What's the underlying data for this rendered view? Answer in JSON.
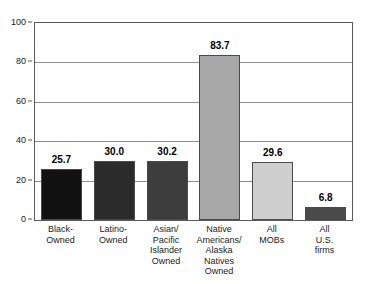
{
  "title_sliver": "",
  "chart_data": {
    "type": "bar",
    "title": "",
    "subtitle": "",
    "xlabel": "",
    "ylabel": "",
    "ylim": [
      0,
      100
    ],
    "y_ticks": [
      0,
      20,
      40,
      60,
      80,
      100
    ],
    "grid": true,
    "legend": "none",
    "orientation": "vertical",
    "categories": [
      "Black-\nOwned",
      "Latino-\nOwned",
      "Asian/\nPacific\nIslander\nOwned",
      "Native\nAmericans/\nAlaska\nNatives\nOwned",
      "All\nMOBs",
      "All U.S.\nfirms"
    ],
    "values": [
      25.7,
      30.0,
      30.2,
      83.7,
      29.6,
      6.8
    ],
    "value_labels": [
      "25.7",
      "30.0",
      "30.2",
      "83.7",
      "29.6",
      "6.8"
    ],
    "bar_colors": [
      "#111111",
      "#2b2b2b",
      "#3d3d3d",
      "#a8a8a8",
      "#cfcfcf",
      "#4a4a4a"
    ],
    "bar_edge_color": "#4a4a4a",
    "gridline_color": "#8c8c8c",
    "frame_color": "#5a5a5a",
    "background": "#ffffff",
    "text_color": "#000000"
  }
}
